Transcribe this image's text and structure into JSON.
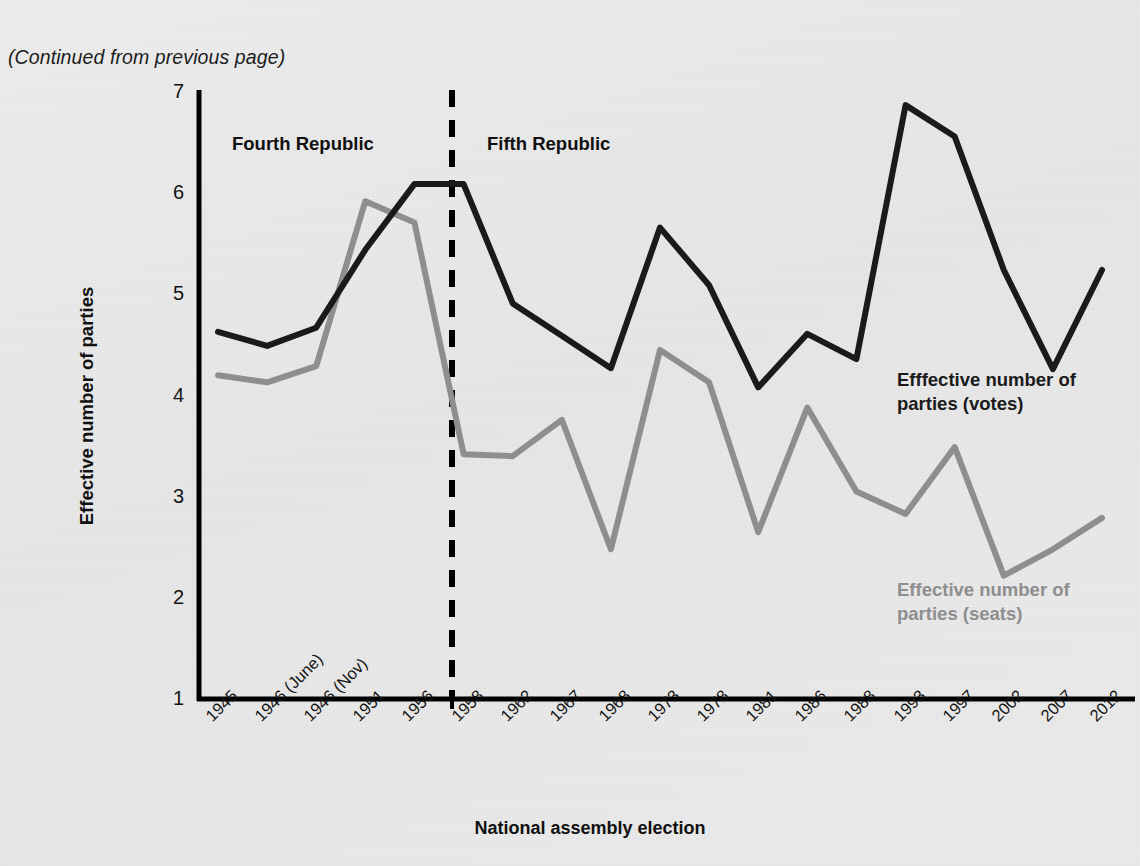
{
  "page": {
    "continued_note": "(Continued from previous page)"
  },
  "annotations": [
    {
      "name": "fourth-republic",
      "text": "Fourth Republic"
    },
    {
      "name": "fifth-republic",
      "text": "Fifth Republic"
    }
  ],
  "series_labels": {
    "votes_line1": "Efffective number of",
    "votes_line2": "parties (votes)",
    "seats_line1": "Effective number of",
    "seats_line2": "parties (seats)"
  },
  "colors": {
    "votes": "#1a1a1a",
    "seats": "#8e8e8e",
    "axis": "#000000",
    "divider": "#000000",
    "background": "#e9e9e9"
  },
  "chart_data": {
    "type": "line",
    "title": "",
    "xlabel": "National assembly election",
    "ylabel": "Effective number of parties",
    "ylim": [
      1,
      7
    ],
    "yticks": [
      1,
      2,
      3,
      4,
      5,
      6,
      7
    ],
    "grid": false,
    "legend_position": "inline-callout",
    "categories": [
      "1945",
      "1946 (June)",
      "1946 (Nov)",
      "1951",
      "1956",
      "1958",
      "1962",
      "1967",
      "1968",
      "1973",
      "1978",
      "1981",
      "1986",
      "1988",
      "1993",
      "1997",
      "2002",
      "2007",
      "2012"
    ],
    "series": [
      {
        "name": "Efffective number of parties (votes)",
        "color": "#1a1a1a",
        "values": [
          4.64,
          4.5,
          4.68,
          5.45,
          6.1,
          6.1,
          4.92,
          4.6,
          4.28,
          5.67,
          5.1,
          4.09,
          4.62,
          4.37,
          6.88,
          6.57,
          5.25,
          4.27,
          5.25
        ]
      },
      {
        "name": "Effective number of parties (seats)",
        "color": "#8e8e8e",
        "values": [
          4.21,
          4.14,
          4.3,
          5.93,
          5.72,
          3.43,
          3.41,
          3.77,
          2.49,
          4.46,
          4.14,
          2.66,
          3.89,
          3.06,
          2.84,
          3.5,
          2.23,
          2.49,
          2.8
        ]
      }
    ],
    "era_divider": {
      "after_category": "1958",
      "style": "dashed",
      "left_label": "Fourth Republic",
      "right_label": "Fifth Republic"
    }
  }
}
